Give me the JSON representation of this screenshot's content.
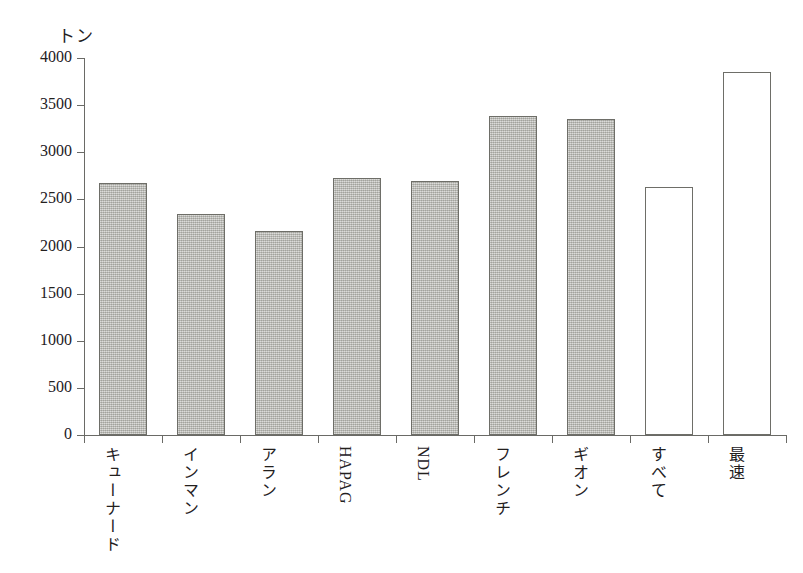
{
  "chart_data": {
    "type": "bar",
    "title": "",
    "subtitle": "",
    "xlabel": "",
    "ylabel": "トン",
    "ylim": [
      0,
      4000
    ],
    "ytick_step": 500,
    "yticks": [
      "0",
      "500",
      "1000",
      "1500",
      "2000",
      "2500",
      "3000",
      "3500",
      "4000"
    ],
    "grid": false,
    "legend": "none",
    "categories": [
      "キューナード",
      "インマン",
      "アラン",
      "HAPAG",
      "NDL",
      "フレンチ",
      "ギオン",
      "すべて",
      "最速"
    ],
    "values": [
      2670,
      2340,
      2160,
      2730,
      2690,
      3380,
      3350,
      2630,
      3850
    ],
    "series": [
      {
        "name": "平均トン数",
        "values": [
          2670,
          2340,
          2160,
          2730,
          2690,
          3380,
          3350,
          2630,
          3850
        ]
      }
    ],
    "bar_styles": [
      "filled",
      "filled",
      "filled",
      "filled",
      "filled",
      "filled",
      "filled",
      "hollow",
      "hollow"
    ],
    "label_scripts": [
      "japanese",
      "japanese",
      "japanese",
      "latin",
      "latin",
      "japanese",
      "japanese",
      "japanese",
      "japanese"
    ],
    "colors": {
      "bar_fill": "#b9b9b3",
      "bar_stroke": "#6e6e68",
      "bar_hollow_fill": "#ffffff",
      "axis": "#6a6a66",
      "text": "#23201e",
      "background": "#ffffff"
    }
  }
}
